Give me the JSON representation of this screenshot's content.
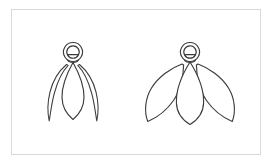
{
  "figure": {
    "title": "",
    "background_color": "#ffffff",
    "frame": {
      "border_color": "#d9d9d9",
      "x": 11,
      "y": 9,
      "width": 250,
      "height": 146
    },
    "stroke_color": "#3c3c3c",
    "fill_color": "#ffffff",
    "shapes": [
      {
        "name": "left-figure",
        "label": "narrow-petal-flower",
        "head": {
          "cx": 73,
          "cy": 52,
          "outer_r": 9.5,
          "inner_r": 6.2
        },
        "petals": [
          {
            "name": "center-petal",
            "type": "vesica",
            "width": 21,
            "top": 62,
            "bottom": 119
          },
          {
            "name": "left-outer-petal",
            "type": "sliver",
            "tip_x": 49,
            "tip_y": 121
          },
          {
            "name": "right-outer-petal",
            "type": "sliver",
            "tip_x": 97,
            "tip_y": 121
          }
        ]
      },
      {
        "name": "right-figure",
        "label": "broad-petal-flower",
        "head": {
          "cx": 190,
          "cy": 52,
          "outer_r": 9.5,
          "inner_r": 6.2
        },
        "petals": [
          {
            "name": "center-petal",
            "type": "vesica",
            "width": 27,
            "top": 62,
            "bottom": 124
          },
          {
            "name": "left-outer-petal",
            "type": "leaf",
            "tip_x": 148,
            "tip_y": 121
          },
          {
            "name": "right-outer-petal",
            "type": "leaf",
            "tip_x": 232,
            "tip_y": 121
          }
        ]
      }
    ]
  }
}
